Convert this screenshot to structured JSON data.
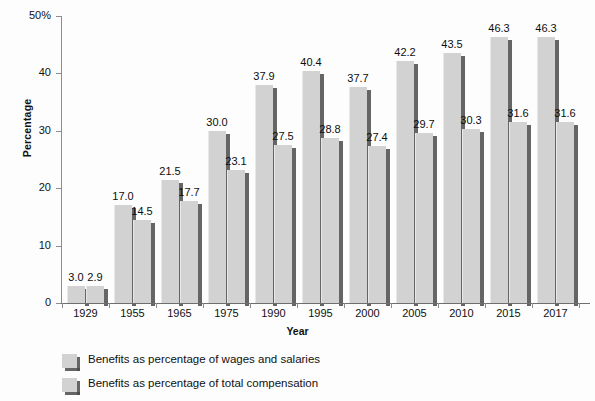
{
  "chart_data": {
    "type": "bar",
    "title": "",
    "xlabel": "Year",
    "ylabel": "Percentage",
    "categories": [
      "1929",
      "1955",
      "1965",
      "1975",
      "1990",
      "1995",
      "2000",
      "2005",
      "2010",
      "2015",
      "2017"
    ],
    "series": [
      {
        "name": "Benefits as percentage of wages and salaries",
        "values": [
          3.0,
          17.0,
          21.5,
          30.0,
          37.9,
          40.4,
          37.7,
          42.2,
          43.5,
          46.3,
          46.3
        ],
        "labels": [
          "3.0",
          "17.0",
          "21.5",
          "30.0",
          "37.9",
          "40.4",
          "37.7",
          "42.2",
          "43.5",
          "46.3",
          "46.3"
        ],
        "color": "#d2d2d2"
      },
      {
        "name": "Benefits as percentage of total compensation",
        "values": [
          2.9,
          14.5,
          17.7,
          23.1,
          27.5,
          28.8,
          27.4,
          29.7,
          30.3,
          31.6,
          31.6
        ],
        "labels": [
          "2.9",
          "14.5",
          "17.7",
          "23.1",
          "27.5",
          "28.8",
          "27.4",
          "29.7",
          "30.3",
          "31.6",
          "31.6"
        ],
        "color": "#d2d2d2"
      }
    ],
    "ylim": [
      0,
      50
    ],
    "yticks": [
      0,
      10,
      20,
      30,
      40,
      50
    ],
    "ytick_labels": [
      "0",
      "10",
      "20",
      "30",
      "40",
      "50%"
    ],
    "grid": false,
    "legend_position": "bottom-left"
  },
  "axis": {
    "y_title": "Percentage",
    "x_title": "Year"
  },
  "legend": {
    "items": [
      {
        "label": "Benefits as percentage of wages and salaries",
        "swatch": "#d2d2d2"
      },
      {
        "label": "Benefits as percentage of total compensation",
        "swatch": "#d2d2d2"
      }
    ]
  },
  "colors": {
    "bar_fill": "#d2d2d2",
    "bar_shadow": "#4a4a4a",
    "axis": "#8d8d8d",
    "text": "#111111",
    "background": "#fdfdfd"
  }
}
